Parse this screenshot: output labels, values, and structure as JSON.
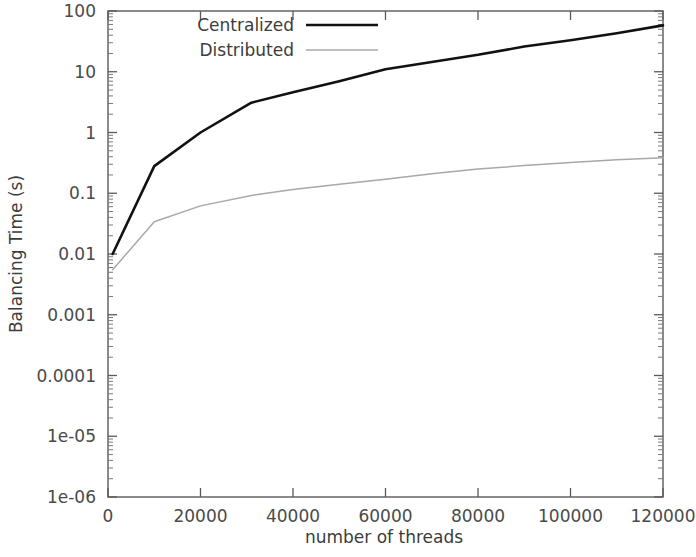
{
  "chart_data": {
    "type": "line",
    "title": "",
    "xlabel": "number of threads",
    "ylabel": "Balancing Time (s)",
    "yscale": "log",
    "xscale": "linear",
    "xlim": [
      0,
      120000
    ],
    "ylim": [
      1e-06,
      100
    ],
    "grid": false,
    "legend_position": "top-left-inside",
    "xticks": [
      0,
      20000,
      40000,
      60000,
      80000,
      100000,
      120000
    ],
    "xtick_labels": [
      "0",
      "20000",
      "40000",
      "60000",
      "80000",
      "100000",
      "120000"
    ],
    "yticks": [
      100,
      10,
      1,
      0.1,
      0.01,
      0.001,
      0.0001,
      1e-05,
      1e-06
    ],
    "ytick_labels": [
      "100",
      "10",
      "1",
      "0.1",
      "0.01",
      "0.001",
      "0.0001",
      "1e-05",
      "1e-06"
    ],
    "series": [
      {
        "name": "Centralized",
        "color": "#111111",
        "linewidth": 2.6,
        "x": [
          1000,
          10000,
          20000,
          31000,
          40000,
          50000,
          60000,
          70000,
          80000,
          90000,
          100000,
          110000,
          120000
        ],
        "y": [
          0.01,
          0.28,
          1.0,
          3.1,
          4.6,
          7.0,
          11.0,
          14.5,
          19.0,
          26.0,
          33.0,
          43.0,
          58.0
        ]
      },
      {
        "name": "Distributed",
        "color": "#a8a8a8",
        "linewidth": 1.5,
        "x": [
          1000,
          10000,
          20000,
          31000,
          40000,
          50000,
          60000,
          70000,
          80000,
          90000,
          100000,
          110000,
          120000
        ],
        "y": [
          0.0055,
          0.034,
          0.062,
          0.092,
          0.115,
          0.14,
          0.17,
          0.21,
          0.25,
          0.285,
          0.32,
          0.355,
          0.385
        ]
      }
    ]
  },
  "legend": {
    "entries": [
      {
        "label": "Centralized"
      },
      {
        "label": "Distributed"
      }
    ]
  },
  "axes": {
    "x_title": "number of threads",
    "y_title": "Balancing Time (s)"
  }
}
